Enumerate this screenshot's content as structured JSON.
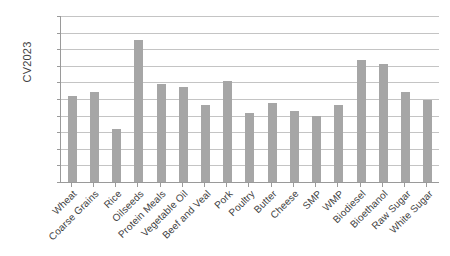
{
  "chart_data": {
    "type": "bar",
    "title": "",
    "xlabel": "",
    "ylabel": "CV2023",
    "ylim": [
      0,
      0.2
    ],
    "grid": true,
    "legend": false,
    "y_tick_labels": [
      "20%",
      "18%",
      "16%",
      "14%",
      "12%",
      "10%",
      "8%",
      "6%",
      "4%",
      "2%",
      "0%"
    ],
    "y_tick_values": [
      20,
      18,
      16,
      14,
      12,
      10,
      8,
      6,
      4,
      2,
      0
    ],
    "bar_color": "#a6a6a6",
    "gridline_color": "#c4c4c4",
    "axis_color": "#9a9a9a",
    "categories": [
      "Wheat",
      "Coarse Grains",
      "Rice",
      "Oilseeds",
      "Protein Meals",
      "Vegetable Oil",
      "Beef and Veal",
      "Pork",
      "Poultry",
      "Butter",
      "Cheese",
      "SMP",
      "WMP",
      "Biodiesel",
      "Bioethanol",
      "Raw Sugar",
      "White Sugar"
    ],
    "values": [
      10.4,
      10.8,
      6.4,
      17.1,
      11.8,
      11.5,
      9.3,
      12.2,
      8.3,
      9.5,
      8.5,
      7.9,
      9.3,
      14.7,
      14.2,
      10.8,
      9.9
    ],
    "value_unit": "%"
  }
}
